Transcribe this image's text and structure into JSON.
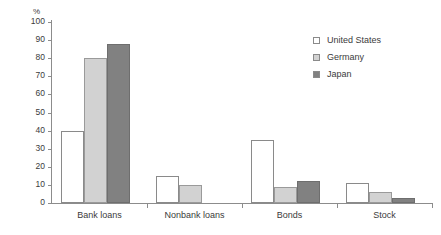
{
  "chart_data": {
    "type": "bar",
    "title": "",
    "xlabel": "",
    "ylabel": "%",
    "ylim": [
      0,
      100
    ],
    "ytick_step": 10,
    "yticks": [
      100,
      90,
      80,
      70,
      60,
      50,
      40,
      30,
      20,
      10,
      0
    ],
    "ytick_labels": [
      "100",
      "90",
      "80",
      "70",
      "60",
      "50",
      "40",
      "30",
      "20",
      "10",
      "0"
    ],
    "grid": false,
    "legend_position": "top-right",
    "categories": [
      "Bank loans",
      "Nonbank loans",
      "Bonds",
      "Stock"
    ],
    "series": [
      {
        "name": "United States",
        "color": "#ffffff",
        "values": [
          40,
          15,
          35,
          11
        ]
      },
      {
        "name": "Germany",
        "color": "#d2d2d2",
        "values": [
          80,
          10,
          9,
          6
        ]
      },
      {
        "name": "Japan",
        "color": "#818181",
        "values": [
          88,
          0,
          12,
          3
        ]
      }
    ]
  }
}
